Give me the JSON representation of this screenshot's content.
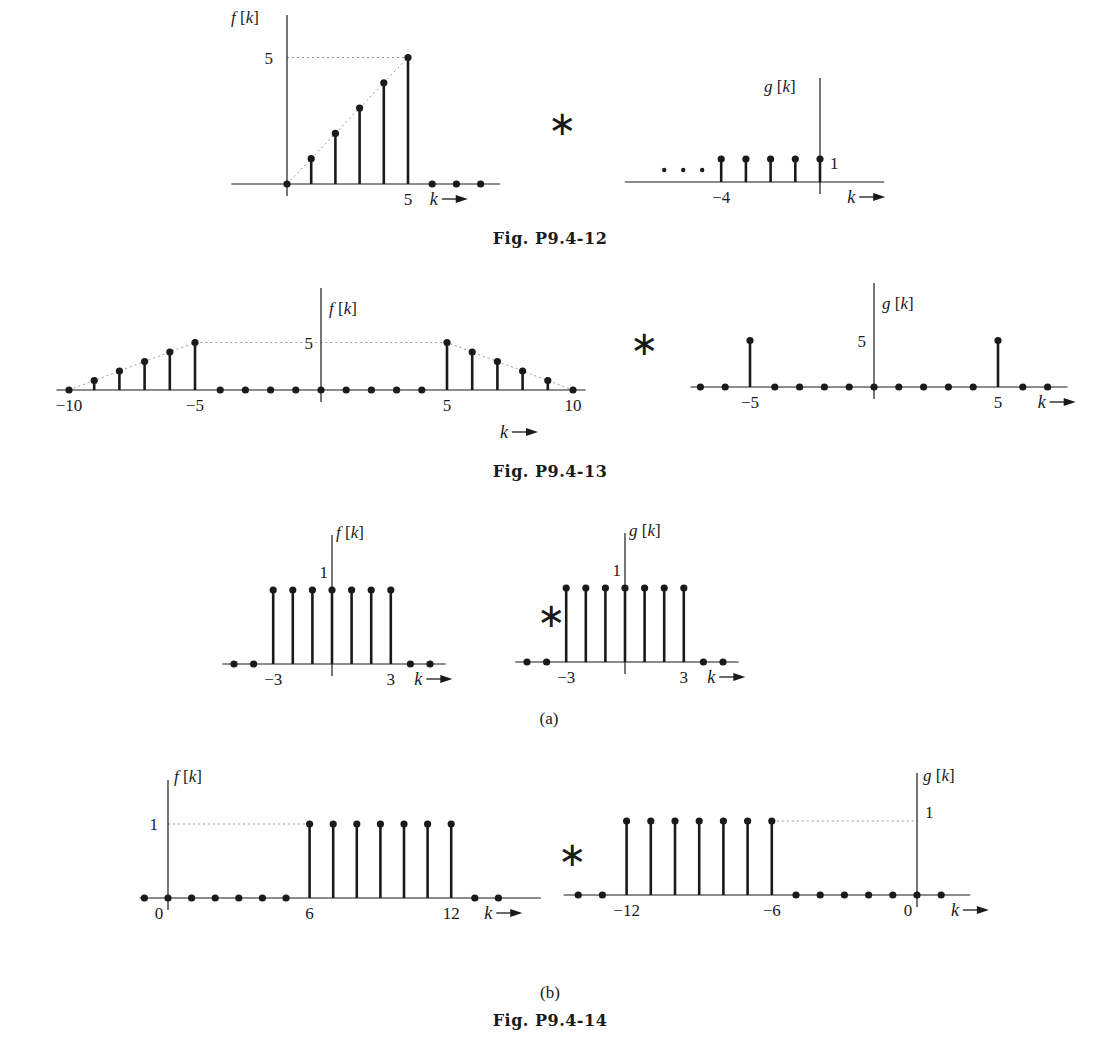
{
  "captions": {
    "fig12": "Fig. P9.4-12",
    "fig13": "Fig. P9.4-13",
    "fig14": "Fig. P9.4-14",
    "sub_a": "(a)",
    "sub_b": "(b)"
  },
  "operators": {
    "convolution": "∗"
  },
  "chart_data": [
    {
      "id": "p12_f",
      "type": "stem",
      "figure": "Fig. P9.4-12",
      "ylabel": "f [k]",
      "xlabel": "k",
      "x": [
        0,
        1,
        2,
        3,
        4,
        5,
        6,
        7,
        8
      ],
      "values": [
        0,
        1,
        2,
        3,
        4,
        5,
        0,
        0,
        0
      ],
      "xticks": [
        {
          "value": 5,
          "label": "5"
        }
      ],
      "yticks": [
        {
          "value": 5,
          "label": "5"
        }
      ],
      "guides": [
        "dotted ramp from (0,0) to (5,5)",
        "dotted horizontal at y=5"
      ],
      "layout": {
        "x0": 287,
        "dx": 24.2,
        "y0": 184,
        "dy": 25.3,
        "xmin": -2.3,
        "xmax": 8.8,
        "ytop": 15
      }
    },
    {
      "id": "p12_g",
      "type": "stem",
      "figure": "Fig. P9.4-12",
      "ylabel": "g [k]",
      "xlabel": "k",
      "x": [
        -4,
        -3,
        -2,
        -1,
        0
      ],
      "values": [
        1,
        1,
        1,
        1,
        1
      ],
      "continues_left": true,
      "xticks": [
        {
          "value": -4,
          "label": "−4"
        }
      ],
      "yticks": [
        {
          "value": 1,
          "label": "1"
        }
      ],
      "layout": {
        "x0": 820,
        "dx": 24.7,
        "y0": 182,
        "dy": 23,
        "xmin": -7.9,
        "xmax": 2.6,
        "ytop": 78
      }
    },
    {
      "id": "p13_f",
      "type": "stem",
      "figure": "Fig. P9.4-13",
      "ylabel": "f [k]",
      "xlabel": "k",
      "x": [
        -10,
        -9,
        -8,
        -7,
        -6,
        -5,
        -4,
        -3,
        -2,
        -1,
        0,
        1,
        2,
        3,
        4,
        5,
        6,
        7,
        8,
        9,
        10
      ],
      "values": [
        0,
        1,
        2,
        3,
        4,
        5,
        0,
        0,
        0,
        0,
        0,
        0,
        0,
        0,
        0,
        5,
        4,
        3,
        2,
        1,
        0
      ],
      "xticks": [
        {
          "value": -10,
          "label": "−10"
        },
        {
          "value": -5,
          "label": "−5"
        },
        {
          "value": 5,
          "label": "5"
        },
        {
          "value": 10,
          "label": "10"
        }
      ],
      "yticks": [
        {
          "value": 5,
          "label": "5"
        }
      ],
      "guides": [
        "dotted envelope (-10,0)-(-5,5)-(5,5)-(10,0)"
      ],
      "layout": {
        "x0": 321,
        "dx": 25.2,
        "y0": 390,
        "dy": 9.5,
        "xmin": -10.5,
        "xmax": 10.5,
        "ytop": 288
      }
    },
    {
      "id": "p13_g",
      "type": "stem",
      "figure": "Fig. P9.4-13",
      "ylabel": "g [k]",
      "xlabel": "k",
      "x": [
        -7,
        -6,
        -5,
        -4,
        -3,
        -2,
        -1,
        0,
        1,
        2,
        3,
        4,
        5,
        6,
        7
      ],
      "values": [
        0,
        0,
        5,
        0,
        0,
        0,
        0,
        0,
        0,
        0,
        0,
        0,
        5,
        0,
        0
      ],
      "xticks": [
        {
          "value": -5,
          "label": "−5"
        },
        {
          "value": 5,
          "label": "5"
        }
      ],
      "yticks": [
        {
          "value": 5,
          "label": "5"
        }
      ],
      "layout": {
        "x0": 874,
        "dx": 24.8,
        "y0": 387,
        "dy": 9.3,
        "xmin": -7.4,
        "xmax": 7.8,
        "ytop": 283
      }
    },
    {
      "id": "p14a_f",
      "type": "stem",
      "figure": "Fig. P9.4-14 (a)",
      "ylabel": "f [k]",
      "xlabel": "k",
      "x": [
        -5,
        -4,
        -3,
        -2,
        -1,
        0,
        1,
        2,
        3,
        4,
        5
      ],
      "values": [
        0,
        0,
        1,
        1,
        1,
        1,
        1,
        1,
        1,
        0,
        0
      ],
      "xticks": [
        {
          "value": -3,
          "label": "−3"
        },
        {
          "value": 3,
          "label": "3"
        }
      ],
      "yticks": [
        {
          "value": 1,
          "label": "1"
        }
      ],
      "layout": {
        "x0": 332,
        "dx": 19.6,
        "y0": 664,
        "dy": 74,
        "xmin": -5.6,
        "xmax": 5.8,
        "ytop": 535
      }
    },
    {
      "id": "p14a_g",
      "type": "stem",
      "figure": "Fig. P9.4-14 (a)",
      "ylabel": "g [k]",
      "xlabel": "k",
      "x": [
        -5,
        -4,
        -3,
        -2,
        -1,
        0,
        1,
        2,
        3,
        4,
        5
      ],
      "values": [
        0,
        0,
        1,
        1,
        1,
        1,
        1,
        1,
        1,
        0,
        0
      ],
      "xticks": [
        {
          "value": -3,
          "label": "−3"
        },
        {
          "value": 3,
          "label": "3"
        }
      ],
      "yticks": [
        {
          "value": 1,
          "label": "1"
        }
      ],
      "layout": {
        "x0": 625,
        "dx": 19.6,
        "y0": 662,
        "dy": 74,
        "xmin": -5.6,
        "xmax": 5.8,
        "ytop": 533
      }
    },
    {
      "id": "p14b_f",
      "type": "stem",
      "figure": "Fig. P9.4-14 (b)",
      "ylabel": "f [k]",
      "xlabel": "k",
      "x": [
        -1,
        0,
        1,
        2,
        3,
        4,
        5,
        6,
        7,
        8,
        9,
        10,
        11,
        12,
        13,
        14
      ],
      "values": [
        0,
        0,
        0,
        0,
        0,
        0,
        0,
        1,
        1,
        1,
        1,
        1,
        1,
        1,
        0,
        0
      ],
      "xticks": [
        {
          "value": 0,
          "label": "0"
        },
        {
          "value": 6,
          "label": "6"
        },
        {
          "value": 12,
          "label": "12"
        }
      ],
      "yticks": [
        {
          "value": 1,
          "label": "1"
        }
      ],
      "guides": [
        "dotted horizontal at y=1 from axis to k=6"
      ],
      "layout": {
        "x0": 168,
        "dx": 23.6,
        "y0": 898,
        "dy": 74,
        "xmin": -1.2,
        "xmax": 15.8,
        "ytop": 780
      }
    },
    {
      "id": "p14b_g",
      "type": "stem",
      "figure": "Fig. P9.4-14 (b)",
      "ylabel": "g [k]",
      "xlabel": "k",
      "x": [
        -14,
        -13,
        -12,
        -11,
        -10,
        -9,
        -8,
        -7,
        -6,
        -5,
        -4,
        -3,
        -2,
        -1,
        0,
        1
      ],
      "values": [
        0,
        0,
        1,
        1,
        1,
        1,
        1,
        1,
        1,
        0,
        0,
        0,
        0,
        0,
        0,
        0
      ],
      "xticks": [
        {
          "value": -12,
          "label": "−12"
        },
        {
          "value": -6,
          "label": "−6"
        },
        {
          "value": 0,
          "label": "0"
        }
      ],
      "yticks": [
        {
          "value": 1,
          "label": "1"
        }
      ],
      "guides": [
        "dotted horizontal at y=1 from k=-6 to axis"
      ],
      "layout": {
        "x0": 917,
        "dx": 24.2,
        "y0": 895,
        "dy": 74,
        "xmin": -14.6,
        "xmax": 2.2,
        "ytop": 773
      }
    }
  ]
}
